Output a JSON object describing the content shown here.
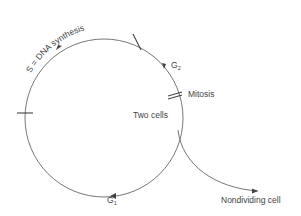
{
  "diagram": {
    "phases": {
      "s_label": "S = DNA synthesis",
      "g2_main": "G",
      "g2_sub": "2",
      "mitosis": "Mitosis",
      "two_cells": "Two cells",
      "g1_main": "G",
      "g1_sub": "1",
      "nondividing": "Nondividing cell"
    },
    "colors": {
      "line": "#666666",
      "text": "#444444",
      "background": "#ffffff"
    }
  }
}
